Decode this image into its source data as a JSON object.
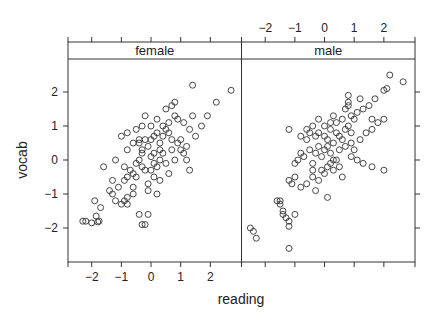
{
  "chart_data": {
    "type": "scatter",
    "layout": "lattice-conditioned",
    "title": "",
    "xlabel": "reading",
    "ylabel": "vocab",
    "xlim": [
      -2.8,
      3.05
    ],
    "ylim": [
      -3.0,
      2.97
    ],
    "x_ticks": [
      -2,
      -1,
      0,
      1,
      2
    ],
    "y_ticks": [
      -2,
      -1,
      0,
      1,
      2
    ],
    "x_tick_labels": [
      "-2",
      "-1",
      "0",
      "1",
      "2"
    ],
    "y_tick_labels": [
      "-2",
      "-1",
      "0",
      "1",
      "2"
    ],
    "x_ticks_bottom_panel": "female",
    "x_ticks_top_panel": "male",
    "y_ticks_left_labeled": true,
    "y_ticks_right_unlabeled": true,
    "grid": false,
    "legend": null,
    "marker": "open-circle",
    "marker_color": "#333333",
    "strip_color": "#ffffff",
    "border_color": "#333333",
    "panels": [
      {
        "strip_label": "female",
        "points": [
          [
            -2.3,
            -1.8
          ],
          [
            -2.2,
            -1.8
          ],
          [
            -2.0,
            -1.85
          ],
          [
            -1.8,
            -1.82
          ],
          [
            -1.75,
            -1.8
          ],
          [
            -1.85,
            -1.65
          ],
          [
            -1.9,
            -1.2
          ],
          [
            -1.7,
            -1.4
          ],
          [
            -1.3,
            -1.0
          ],
          [
            -1.2,
            -1.2
          ],
          [
            -1.0,
            -1.3
          ],
          [
            -0.9,
            -1.2
          ],
          [
            -0.8,
            -1.3
          ],
          [
            -0.8,
            -1.1
          ],
          [
            -0.6,
            -1.0
          ],
          [
            -0.4,
            -1.6
          ],
          [
            -0.1,
            -1.6
          ],
          [
            -0.3,
            -1.9
          ],
          [
            -0.2,
            -1.9
          ],
          [
            -1.6,
            -0.2
          ],
          [
            -1.3,
            -0.6
          ],
          [
            -1.1,
            -0.8
          ],
          [
            -0.9,
            -0.6
          ],
          [
            -0.8,
            -0.5
          ],
          [
            -0.7,
            -0.3
          ],
          [
            -0.6,
            -0.4
          ],
          [
            -0.5,
            -0.5
          ],
          [
            -0.5,
            -0.1
          ],
          [
            -0.3,
            -0.2
          ],
          [
            -0.4,
            0.0
          ],
          [
            -0.2,
            -0.3
          ],
          [
            -0.1,
            -0.7
          ],
          [
            -0.1,
            -0.9
          ],
          [
            0.1,
            -0.5
          ],
          [
            0.0,
            -0.3
          ],
          [
            0.2,
            -1.0
          ],
          [
            0.3,
            -0.6
          ],
          [
            0.6,
            -0.4
          ],
          [
            0.5,
            -0.1
          ],
          [
            0.3,
            0.0
          ],
          [
            0.1,
            0.2
          ],
          [
            0.0,
            0.1
          ],
          [
            -0.8,
            0.3
          ],
          [
            -0.6,
            0.5
          ],
          [
            -0.4,
            0.5
          ],
          [
            -0.3,
            0.3
          ],
          [
            -0.2,
            0.6
          ],
          [
            -0.1,
            0.4
          ],
          [
            0.1,
            0.7
          ],
          [
            0.2,
            0.8
          ],
          [
            -1.0,
            0.7
          ],
          [
            -0.8,
            0.8
          ],
          [
            -0.5,
            0.9
          ],
          [
            -0.4,
            0.6
          ],
          [
            -0.3,
            0.2
          ],
          [
            0.0,
            0.6
          ],
          [
            0.3,
            0.5
          ],
          [
            0.4,
            0.7
          ],
          [
            0.5,
            0.9
          ],
          [
            0.6,
            0.8
          ],
          [
            0.7,
            0.3
          ],
          [
            0.8,
            0.0
          ],
          [
            0.9,
            0.5
          ],
          [
            1.0,
            0.3
          ],
          [
            1.1,
            0.2
          ],
          [
            1.2,
            0.4
          ],
          [
            0.9,
            1.2
          ],
          [
            1.1,
            1.1
          ],
          [
            1.3,
            0.9
          ],
          [
            1.4,
            1.3
          ],
          [
            1.0,
            0.6
          ],
          [
            0.7,
            0.6
          ],
          [
            0.2,
            1.2
          ],
          [
            0.4,
            1.0
          ],
          [
            0.5,
            1.5
          ],
          [
            0.7,
            1.6
          ],
          [
            0.8,
            1.7
          ],
          [
            -0.2,
            1.3
          ],
          [
            -0.3,
            1.0
          ],
          [
            0.0,
            1.0
          ],
          [
            0.6,
            1.1
          ],
          [
            0.8,
            1.3
          ],
          [
            1.5,
            0.7
          ],
          [
            1.7,
            1.0
          ],
          [
            1.9,
            1.3
          ],
          [
            2.2,
            1.7
          ],
          [
            1.4,
            2.2
          ],
          [
            2.7,
            2.05
          ],
          [
            1.2,
            0.0
          ],
          [
            1.3,
            -0.3
          ],
          [
            -1.4,
            -0.9
          ],
          [
            -0.9,
            -0.2
          ],
          [
            -0.6,
            -0.8
          ],
          [
            0.3,
            0.3
          ],
          [
            0.2,
            -0.2
          ],
          [
            0.4,
            0.2
          ],
          [
            -1.2,
            0.0
          ],
          [
            0.1,
            -0.1
          ]
        ]
      },
      {
        "strip_label": "male",
        "points": [
          [
            -2.5,
            -2.0
          ],
          [
            -2.4,
            -2.1
          ],
          [
            -2.3,
            -2.3
          ],
          [
            -1.2,
            -2.6
          ],
          [
            -1.6,
            -1.2
          ],
          [
            -1.5,
            -1.2
          ],
          [
            -1.5,
            -1.3
          ],
          [
            -1.4,
            -1.5
          ],
          [
            -1.4,
            -1.6
          ],
          [
            -1.3,
            -1.7
          ],
          [
            -1.2,
            -1.8
          ],
          [
            -1.2,
            -1.95
          ],
          [
            -1.0,
            -1.6
          ],
          [
            -1.2,
            -0.6
          ],
          [
            -1.1,
            -0.7
          ],
          [
            -1.0,
            -0.5
          ],
          [
            -0.8,
            -0.8
          ],
          [
            -0.6,
            -0.7
          ],
          [
            -0.4,
            -0.5
          ],
          [
            -0.3,
            -0.9
          ],
          [
            -0.2,
            -0.6
          ],
          [
            0.1,
            -1.1
          ],
          [
            -1.2,
            0.9
          ],
          [
            -1.0,
            -0.1
          ],
          [
            -0.9,
            0.0
          ],
          [
            -0.8,
            0.2
          ],
          [
            -0.7,
            0.1
          ],
          [
            -0.5,
            0.3
          ],
          [
            -0.4,
            -0.1
          ],
          [
            -0.3,
            0.2
          ],
          [
            -0.2,
            0.4
          ],
          [
            -0.1,
            0.1
          ],
          [
            0.0,
            0.3
          ],
          [
            0.1,
            -0.2
          ],
          [
            0.2,
            -0.1
          ],
          [
            0.3,
            -0.3
          ],
          [
            0.4,
            0.0
          ],
          [
            0.5,
            -0.2
          ],
          [
            -0.6,
            0.6
          ],
          [
            -0.5,
            0.8
          ],
          [
            -0.3,
            0.7
          ],
          [
            -0.2,
            0.8
          ],
          [
            0.0,
            0.7
          ],
          [
            0.1,
            0.6
          ],
          [
            0.2,
            0.9
          ],
          [
            0.3,
            0.5
          ],
          [
            0.4,
            0.8
          ],
          [
            0.5,
            0.7
          ],
          [
            0.6,
            0.6
          ],
          [
            0.7,
            0.9
          ],
          [
            0.8,
            1.0
          ],
          [
            0.9,
            0.8
          ],
          [
            0.4,
            1.1
          ],
          [
            0.6,
            1.2
          ],
          [
            0.0,
            1.0
          ],
          [
            0.2,
            1.1
          ],
          [
            0.3,
            1.3
          ],
          [
            -0.2,
            1.2
          ],
          [
            -0.4,
            1.0
          ],
          [
            -0.6,
            0.9
          ],
          [
            -0.8,
            0.7
          ],
          [
            0.1,
            0.4
          ],
          [
            0.2,
            0.2
          ],
          [
            0.3,
            0.0
          ],
          [
            0.5,
            0.3
          ],
          [
            0.7,
            0.4
          ],
          [
            0.9,
            0.5
          ],
          [
            1.0,
            0.3
          ],
          [
            1.2,
            0.6
          ],
          [
            0.7,
            1.5
          ],
          [
            0.8,
            1.6
          ],
          [
            0.9,
            1.3
          ],
          [
            1.0,
            1.2
          ],
          [
            1.1,
            1.4
          ],
          [
            1.3,
            1.5
          ],
          [
            1.5,
            1.6
          ],
          [
            1.6,
            1.2
          ],
          [
            0.8,
            1.9
          ],
          [
            0.8,
            1.7
          ],
          [
            1.2,
            1.8
          ],
          [
            1.7,
            1.8
          ],
          [
            2.0,
            2.05
          ],
          [
            2.1,
            2.1
          ],
          [
            2.2,
            2.5
          ],
          [
            2.65,
            2.3
          ],
          [
            1.4,
            0.8
          ],
          [
            1.6,
            0.9
          ],
          [
            1.8,
            1.1
          ],
          [
            2.0,
            1.2
          ],
          [
            1.3,
            -0.1
          ],
          [
            1.6,
            -0.2
          ],
          [
            2.0,
            -0.3
          ],
          [
            -0.4,
            -0.3
          ],
          [
            0.0,
            -0.4
          ],
          [
            0.6,
            -0.5
          ],
          [
            -0.1,
            -0.3
          ],
          [
            0.9,
            0.1
          ],
          [
            1.1,
            0.0
          ]
        ]
      }
    ]
  }
}
